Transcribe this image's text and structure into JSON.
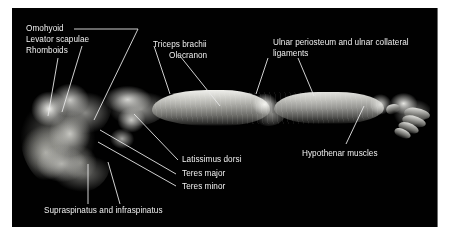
{
  "figure": {
    "background_color": "#ffffff",
    "plate_color": "#010101",
    "label_color": "#f0f0f0",
    "leader_color": "#e8e8e8"
  },
  "labels": [
    {
      "id": "omohyoid",
      "text": "Omohyoid"
    },
    {
      "id": "levator-scapulae",
      "text": "Levator scapulae"
    },
    {
      "id": "rhomboids",
      "text": "Rhomboids"
    },
    {
      "id": "triceps-brachii",
      "text": "Triceps brachii"
    },
    {
      "id": "olecranon",
      "text": "Olecranon"
    },
    {
      "id": "ulnar-periosteum",
      "text": "Ulnar periosteum and ulnar collateral"
    },
    {
      "id": "ligaments",
      "text": "ligaments"
    },
    {
      "id": "hypothenar",
      "text": "Hypothenar muscles"
    },
    {
      "id": "latissimus-dorsi",
      "text": "Latissimus dorsi"
    },
    {
      "id": "teres-major",
      "text": "Teres major"
    },
    {
      "id": "teres-minor",
      "text": "Teres minor"
    },
    {
      "id": "supraspinatus",
      "text": "Supraspinatus and infraspinatus"
    }
  ]
}
